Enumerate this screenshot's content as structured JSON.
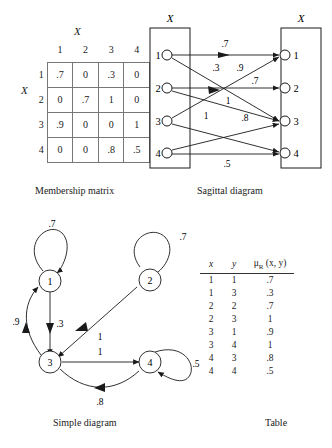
{
  "figure": {
    "captions": {
      "matrix": "Membership matrix",
      "sagittal": "Sagittal diagram",
      "simple": "Simple diagram",
      "table": "Table"
    }
  },
  "matrix": {
    "top_axis_label": "X",
    "side_axis_label": "X",
    "col_headers": [
      "1",
      "2",
      "3",
      "4"
    ],
    "row_headers": [
      "1",
      "2",
      "3",
      "4"
    ],
    "rows": [
      [
        ".7",
        "0",
        ".3",
        "0"
      ],
      [
        "0",
        ".7",
        "1",
        "0"
      ],
      [
        ".9",
        "0",
        "0",
        "1"
      ],
      [
        "0",
        "0",
        ".8",
        ".5"
      ]
    ]
  },
  "sagittal": {
    "left_label": "X",
    "right_label": "X",
    "left_nodes": [
      "1",
      "2",
      "3",
      "4"
    ],
    "right_nodes": [
      "1",
      "2",
      "3",
      "4"
    ],
    "edges": [
      {
        "from": "1",
        "to": "1",
        "label": ".7"
      },
      {
        "from": "1",
        "to": "3",
        "label": ".3"
      },
      {
        "from": "2",
        "to": "2",
        "label": ".7"
      },
      {
        "from": "2",
        "to": "3",
        "label": "1"
      },
      {
        "from": "3",
        "to": "1",
        "label": ".9"
      },
      {
        "from": "3",
        "to": "4",
        "label": "1"
      },
      {
        "from": "4",
        "to": "3",
        "label": ".8"
      },
      {
        "from": "4",
        "to": "4",
        "label": ".5"
      }
    ],
    "edge_labels": [
      ".7",
      ".3",
      ".9",
      ".7",
      "1",
      "1",
      ".8",
      ".5"
    ]
  },
  "simple": {
    "nodes": [
      "1",
      "2",
      "3",
      "4"
    ],
    "edge_labels": {
      "loop1": ".7",
      "loop2": ".7",
      "loop4": ".5",
      "n3_to_n1": ".9",
      "n1_to_n3": ".3",
      "n2_to_n3": "1",
      "n3_to_n4": "1",
      "n4_to_n3": ".8"
    }
  },
  "relation_table": {
    "headers": {
      "x": "x",
      "y": "y",
      "mu": "μR (x, y)"
    },
    "mu_base": "μ",
    "mu_sub": "R",
    "mu_args": "(x, y)",
    "rows": [
      {
        "x": "1",
        "y": "1",
        "mu": ".7"
      },
      {
        "x": "1",
        "y": "3",
        "mu": ".3"
      },
      {
        "x": "2",
        "y": "2",
        "mu": ".7"
      },
      {
        "x": "2",
        "y": "3",
        "mu": "1"
      },
      {
        "x": "3",
        "y": "1",
        "mu": ".9"
      },
      {
        "x": "3",
        "y": "4",
        "mu": "1"
      },
      {
        "x": "4",
        "y": "3",
        "mu": ".8"
      },
      {
        "x": "4",
        "y": "4",
        "mu": ".5"
      }
    ]
  },
  "colors": {
    "ink": "#1a1a1a",
    "grid": "#777777",
    "background": "#ffffff"
  }
}
